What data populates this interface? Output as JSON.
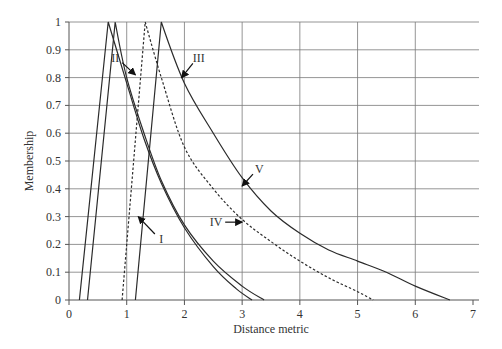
{
  "chart_data": {
    "type": "line",
    "title": "",
    "xlabel": "Distance metric",
    "ylabel": "Membership",
    "xlim": [
      0,
      7
    ],
    "ylim": [
      0,
      1
    ],
    "x_ticks": [
      "0",
      "1",
      "2",
      "3",
      "4",
      "5",
      "6",
      "7"
    ],
    "y_ticks": [
      "0",
      "0.1",
      "0.2",
      "0.3",
      "0.4",
      "0.5",
      "0.6",
      "0.7",
      "0.8",
      "0.9",
      "1"
    ],
    "grid": true,
    "legend": "none (curves labelled with arrows)",
    "series": [
      {
        "name": "I",
        "style": "solid",
        "points": [
          [
            0.32,
            0
          ],
          [
            0.8,
            1
          ],
          [
            1.0,
            0.8
          ],
          [
            1.3,
            0.6
          ],
          [
            1.6,
            0.43
          ],
          [
            2.0,
            0.27
          ],
          [
            2.5,
            0.14
          ],
          [
            3.0,
            0.05
          ],
          [
            3.38,
            0
          ]
        ]
      },
      {
        "name": "II",
        "style": "solid",
        "points": [
          [
            0.18,
            0
          ],
          [
            0.68,
            1
          ],
          [
            1.0,
            0.78
          ],
          [
            1.3,
            0.58
          ],
          [
            1.6,
            0.42
          ],
          [
            2.0,
            0.26
          ],
          [
            2.5,
            0.12
          ],
          [
            2.9,
            0.04
          ],
          [
            3.17,
            0
          ]
        ]
      },
      {
        "name": "III",
        "style": "solid",
        "points": [
          [
            1.15,
            0
          ],
          [
            1.6,
            1
          ],
          [
            2.0,
            0.78
          ],
          [
            2.5,
            0.6
          ],
          [
            3.0,
            0.44
          ],
          [
            3.5,
            0.32
          ],
          [
            4.0,
            0.24
          ],
          [
            4.5,
            0.18
          ],
          [
            5.0,
            0.14
          ],
          [
            5.5,
            0.1
          ],
          [
            6.0,
            0.05
          ],
          [
            6.6,
            0
          ]
        ]
      },
      {
        "name": "IV",
        "style": "dashed",
        "points": [
          [
            0.92,
            0
          ],
          [
            1.32,
            1
          ],
          [
            1.6,
            0.8
          ],
          [
            2.0,
            0.55
          ],
          [
            2.5,
            0.4
          ],
          [
            3.0,
            0.29
          ],
          [
            3.5,
            0.21
          ],
          [
            4.0,
            0.14
          ],
          [
            4.5,
            0.08
          ],
          [
            5.0,
            0.03
          ],
          [
            5.27,
            0
          ]
        ]
      },
      {
        "name": "V",
        "style": "solid",
        "note": "tail of curve III (arrow points to lower portion)",
        "points": []
      }
    ],
    "annotations": [
      {
        "text": "I",
        "label_xy": [
          1.6,
          0.22
        ],
        "arrow_to": [
          1.2,
          0.3
        ]
      },
      {
        "text": "II",
        "label_xy": [
          0.8,
          0.87
        ],
        "arrow_to": [
          1.15,
          0.81
        ]
      },
      {
        "text": "III",
        "label_xy": [
          2.25,
          0.87
        ],
        "arrow_to": [
          1.95,
          0.8
        ]
      },
      {
        "text": "IV",
        "label_xy": [
          2.55,
          0.28
        ],
        "arrow_to": [
          3.0,
          0.28
        ]
      },
      {
        "text": "V",
        "label_xy": [
          3.3,
          0.47
        ],
        "arrow_to": [
          3.0,
          0.41
        ]
      }
    ]
  },
  "labels": {
    "xlabel": "Distance metric",
    "ylabel": "Membership",
    "I": "I",
    "II": "II",
    "III": "III",
    "IV": "IV",
    "V": "V"
  }
}
